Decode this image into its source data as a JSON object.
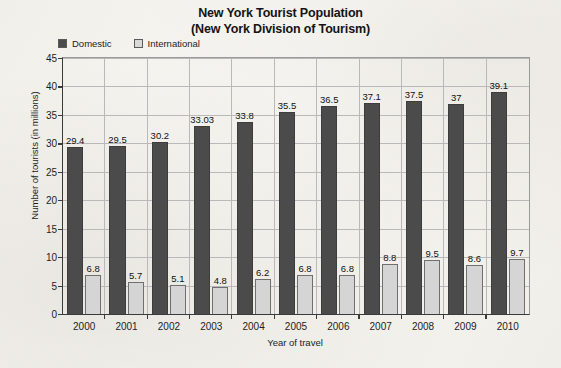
{
  "chart_data": {
    "type": "bar",
    "title": "New York Tourist Population",
    "subtitle": "(New York Division of Tourism)",
    "xlabel": "Year of travel",
    "ylabel": "Number of tourists (in millions)",
    "ylim": [
      0,
      45
    ],
    "ytick_step": 5,
    "yticks": [
      "45",
      "40",
      "35",
      "30",
      "25",
      "20",
      "15",
      "10",
      "5",
      "0"
    ],
    "grid": "horizontal-and-category-separators",
    "legend_position": "top-left",
    "categories": [
      "2000",
      "2001",
      "2002",
      "2003",
      "2004",
      "2005",
      "2006",
      "2007",
      "2008",
      "2009",
      "2010"
    ],
    "series": [
      {
        "name": "Domestic",
        "color": "#4b4b4b",
        "values": [
          29.4,
          29.5,
          30.2,
          33.03,
          33.8,
          35.5,
          36.5,
          37.1,
          37.5,
          37,
          39.1
        ],
        "labels": [
          "29.4",
          "29.5",
          "30.2",
          "33.03",
          "33.8",
          "35.5",
          "36.5",
          "37.1",
          "37.5",
          "37",
          "39.1"
        ]
      },
      {
        "name": "International",
        "color": "#d5d5d5",
        "values": [
          6.8,
          5.7,
          5.1,
          4.8,
          6.2,
          6.8,
          6.8,
          8.8,
          9.5,
          8.6,
          9.7
        ],
        "labels": [
          "6.8",
          "5.7",
          "5.1",
          "4.8",
          "6.2",
          "6.8",
          "6.8",
          "8.8",
          "9.5",
          "8.6",
          "9.7"
        ]
      }
    ]
  },
  "legend": {
    "items": [
      {
        "label": "Domestic",
        "swatch": "domestic"
      },
      {
        "label": "International",
        "swatch": "international"
      }
    ]
  }
}
